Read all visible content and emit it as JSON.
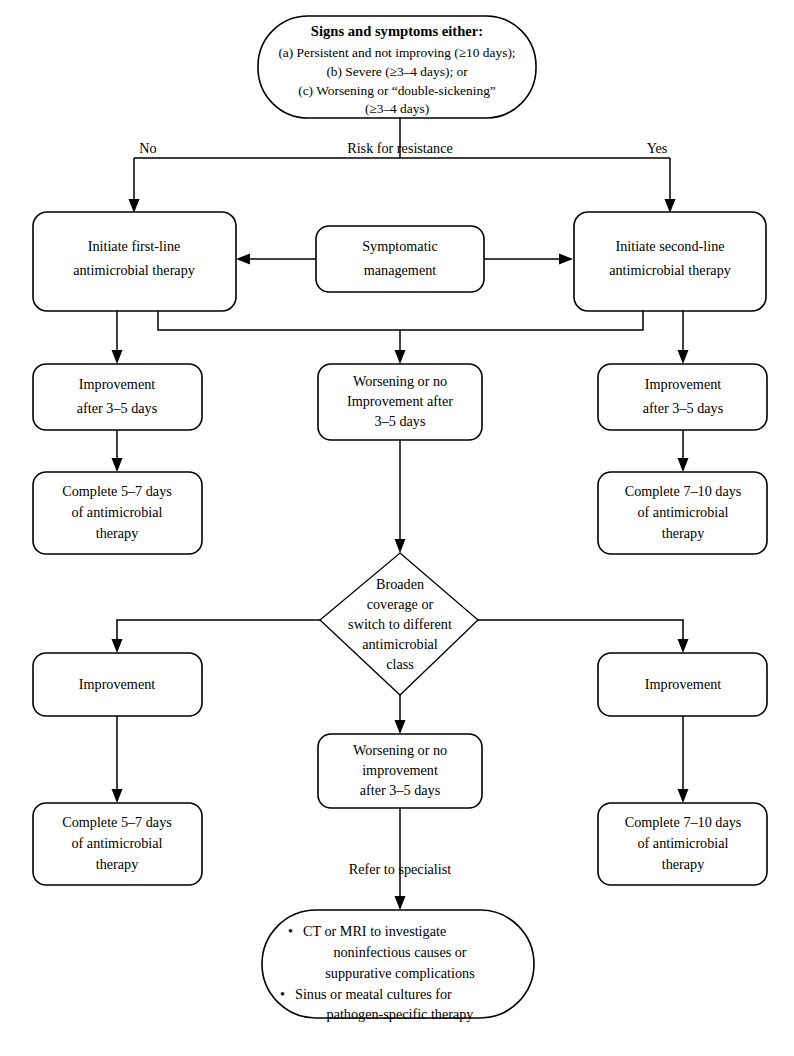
{
  "diagram": {
    "type": "flowchart",
    "nodes": {
      "start": {
        "shape": "stadium",
        "heading": "Signs and symptoms either:",
        "line1": "(a) Persistent and not improving (≥10 days);",
        "line2": "(b) Severe (≥3–4 days); or",
        "line3": "(c) Worsening or “double-sickening”",
        "line4": "(≥3–4 days)"
      },
      "first_line": {
        "shape": "rounded-rect",
        "line1": "Initiate first-line",
        "line2": "antimicrobial therapy"
      },
      "symptomatic": {
        "shape": "rounded-rect",
        "line1": "Symptomatic",
        "line2": "management"
      },
      "second_line": {
        "shape": "rounded-rect",
        "line1": "Initiate second-line",
        "line2": "antimicrobial therapy"
      },
      "improvement_left_1": {
        "shape": "rounded-rect",
        "line1": "Improvement",
        "line2": "after 3–5 days"
      },
      "worsening_1": {
        "shape": "rounded-rect",
        "line1": "Worsening or no",
        "line2": "Improvement after",
        "line3": "3–5 days"
      },
      "improvement_right_1": {
        "shape": "rounded-rect",
        "line1": "Improvement",
        "line2": "after 3–5 days"
      },
      "complete_left_1": {
        "shape": "rounded-rect",
        "line1": "Complete 5–7 days",
        "line2": "of antimicrobial",
        "line3": "therapy"
      },
      "complete_right_1": {
        "shape": "rounded-rect",
        "line1": "Complete 7–10 days",
        "line2": "of antimicrobial",
        "line3": "therapy"
      },
      "broaden": {
        "shape": "diamond",
        "line1": "Broaden",
        "line2": "coverage or",
        "line3": "switch to different",
        "line4": "antimicrobial",
        "line5": "class"
      },
      "improvement_left_2": {
        "shape": "rounded-rect",
        "line1": "Improvement"
      },
      "worsening_2": {
        "shape": "rounded-rect",
        "line1": "Worsening or no",
        "line2": "improvement",
        "line3": "after 3–5 days"
      },
      "improvement_right_2": {
        "shape": "rounded-rect",
        "line1": "Improvement"
      },
      "complete_left_2": {
        "shape": "rounded-rect",
        "line1": "Complete 5–7 days",
        "line2": "of antimicrobial",
        "line3": "therapy"
      },
      "complete_right_2": {
        "shape": "rounded-rect",
        "line1": "Complete 7–10 days",
        "line2": "of antimicrobial",
        "line3": "therapy"
      },
      "specialist": {
        "shape": "stadium",
        "bullet1_line1": "CT or MRI to investigate",
        "bullet1_line2": "noninfectious causes or",
        "bullet1_line3": "suppurative complications",
        "bullet2_line1": "Sinus or meatal cultures for",
        "bullet2_line2": "pathogen-specific therapy",
        "bullet_glyph": "•"
      }
    },
    "edge_labels": {
      "risk_for_resistance": "Risk for resistance",
      "no": "No",
      "yes": "Yes",
      "refer_to_specialist": "Refer to specialist"
    },
    "colors": {
      "stroke": "#000000",
      "fill": "#ffffff",
      "text": "#000000"
    }
  }
}
